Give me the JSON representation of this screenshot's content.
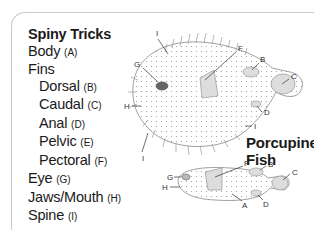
{
  "legend": {
    "title": "Spiny Tricks",
    "items": [
      {
        "label": "Body",
        "code": "(A)",
        "indent": 0
      },
      {
        "label": "Fins",
        "code": "",
        "indent": 0
      },
      {
        "label": "Dorsal",
        "code": "(B)",
        "indent": 1
      },
      {
        "label": "Caudal",
        "code": "(C)",
        "indent": 1
      },
      {
        "label": "Anal",
        "code": "(D)",
        "indent": 1
      },
      {
        "label": "Pelvic",
        "code": "(E)",
        "indent": 1
      },
      {
        "label": "Pectoral",
        "code": "(F)",
        "indent": 1
      },
      {
        "label": "Eye",
        "code": "(G)",
        "indent": 0
      },
      {
        "label": "Jaws/Mouth",
        "code": "(H)",
        "indent": 0
      },
      {
        "label": "Spine",
        "code": "(I)",
        "indent": 0
      }
    ]
  },
  "caption": {
    "line1": "Porcupine",
    "line2": "Fish"
  },
  "diagram_labels": {
    "inflated": [
      "I",
      "G",
      "F",
      "B",
      "C",
      "H",
      "D",
      "I",
      "I"
    ],
    "deflated": [
      "F",
      "B",
      "C",
      "G",
      "H",
      "A",
      "D"
    ]
  }
}
